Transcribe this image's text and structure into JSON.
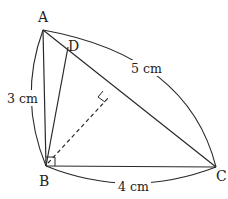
{
  "diagram": {
    "type": "geometry",
    "vertices": {
      "A": {
        "label": "A",
        "x": 43,
        "y": 30
      },
      "B": {
        "label": "B",
        "x": 46,
        "y": 166
      },
      "C": {
        "label": "C",
        "x": 216,
        "y": 167
      },
      "D": {
        "label": "D",
        "x": 68,
        "y": 47
      }
    },
    "foot_of_perpendicular": {
      "x": 110,
      "y": 96
    },
    "measurements": {
      "AB": "3 cm",
      "AC": "5 cm",
      "BC": "4 cm"
    },
    "segments": [
      {
        "from": "A",
        "to": "B",
        "style": "solid"
      },
      {
        "from": "B",
        "to": "C",
        "style": "solid"
      },
      {
        "from": "A",
        "to": "C",
        "style": "solid"
      },
      {
        "from": "B",
        "to": "D",
        "style": "solid"
      },
      {
        "from": "B",
        "to": "foot",
        "style": "dashed"
      }
    ],
    "right_angles": [
      "B",
      "foot"
    ],
    "colors": {
      "stroke": "#2a2a2a",
      "text": "#222222",
      "background": "#ffffff"
    }
  }
}
